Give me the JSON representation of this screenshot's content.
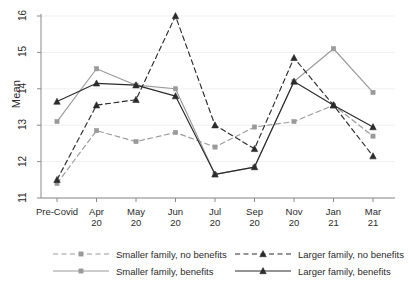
{
  "chart_data": {
    "type": "line",
    "title": "",
    "xlabel": "",
    "ylabel": "Mean",
    "ylim": [
      11,
      16
    ],
    "yticks": [
      11,
      12,
      13,
      14,
      15,
      16
    ],
    "ytick_labels": [
      "11",
      "12",
      "13",
      "14",
      "15",
      "16"
    ],
    "grid": false,
    "legend_position": "bottom",
    "categories": [
      "Pre-Covid",
      "Apr 20",
      "May 20",
      "Jun 20",
      "Jul 20",
      "Sep 20",
      "Nov 20",
      "Jan 21",
      "Mar 21"
    ],
    "category_lines": [
      [
        "Pre-Covid",
        ""
      ],
      [
        "Apr",
        "20"
      ],
      [
        "May",
        "20"
      ],
      [
        "Jun",
        "20"
      ],
      [
        "Jul",
        "20"
      ],
      [
        "Sep",
        "20"
      ],
      [
        "Nov",
        "20"
      ],
      [
        "Jan",
        "21"
      ],
      [
        "Mar",
        "21"
      ]
    ],
    "series": [
      {
        "name": "Smaller family, no benefits",
        "color": "#9a9a9a",
        "dash": "dashed",
        "marker": "square",
        "values": [
          11.4,
          12.85,
          12.55,
          12.8,
          12.4,
          12.95,
          13.1,
          13.55,
          12.7
        ]
      },
      {
        "name": "Smaller family, benefits",
        "color": "#9a9a9a",
        "dash": "solid",
        "marker": "square",
        "values": [
          13.1,
          14.55,
          14.1,
          14.0,
          11.65,
          11.85,
          14.2,
          15.1,
          13.9
        ]
      },
      {
        "name": "Larger family, no benefits",
        "color": "#2b2b2b",
        "dash": "dashed",
        "marker": "triangle",
        "values": [
          11.5,
          13.55,
          13.7,
          16.0,
          13.0,
          12.35,
          14.85,
          13.55,
          12.15
        ]
      },
      {
        "name": "Larger family, benefits",
        "color": "#2b2b2b",
        "dash": "solid",
        "marker": "triangle",
        "values": [
          13.65,
          14.15,
          14.1,
          13.8,
          11.65,
          11.85,
          14.2,
          13.55,
          12.95
        ]
      }
    ]
  },
  "legend": {
    "items": [
      {
        "label": "Smaller family, no benefits"
      },
      {
        "label": "Smaller family, benefits"
      },
      {
        "label": "Larger family, no benefits"
      },
      {
        "label": "Larger family, benefits"
      }
    ]
  },
  "axes": {
    "y_title": "Mean"
  },
  "colors": {
    "smaller_family": "#9a9a9a",
    "larger_family": "#2b2b2b",
    "axis": "#8a8a8a",
    "background": "#ffffff"
  }
}
